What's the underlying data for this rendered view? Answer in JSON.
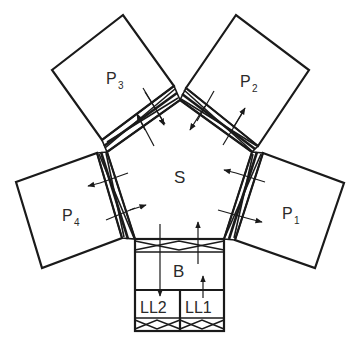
{
  "diagram": {
    "title": "",
    "type": "cluster-tool-layout",
    "nodes": [
      {
        "id": "S",
        "label": "S",
        "description": "central transfer chamber (pentagon)"
      },
      {
        "id": "P1",
        "label": "P",
        "subscript": "1",
        "description": "process chamber 1"
      },
      {
        "id": "P2",
        "label": "P",
        "subscript": "2",
        "description": "process chamber 2"
      },
      {
        "id": "P3",
        "label": "P",
        "subscript": "3",
        "description": "process chamber 3"
      },
      {
        "id": "P4",
        "label": "P",
        "subscript": "4",
        "description": "process chamber 4"
      },
      {
        "id": "B",
        "label": "B",
        "description": "buffer chamber"
      },
      {
        "id": "LL1",
        "label": "LL1",
        "description": "load lock 1"
      },
      {
        "id": "LL2",
        "label": "LL2",
        "description": "load lock 2"
      }
    ],
    "edges": [
      {
        "from": "S",
        "to": "P1",
        "type": "bidirectional",
        "via": "gate valve"
      },
      {
        "from": "S",
        "to": "P2",
        "type": "bidirectional",
        "via": "gate valve"
      },
      {
        "from": "S",
        "to": "P3",
        "type": "bidirectional",
        "via": "gate valve"
      },
      {
        "from": "S",
        "to": "P4",
        "type": "bidirectional",
        "via": "gate valve"
      },
      {
        "from": "B",
        "to": "S",
        "type": "directed",
        "via": "gate valve"
      },
      {
        "from": "S",
        "to": "LL2",
        "type": "directed",
        "via": "B"
      },
      {
        "from": "LL1",
        "to": "B",
        "type": "directed"
      }
    ]
  },
  "labels": {
    "S": "S",
    "B": "B",
    "LL1": "LL1",
    "LL2": "LL2",
    "P1_main": "P",
    "P1_sub": "1",
    "P2_main": "P",
    "P2_sub": "2",
    "P3_main": "P",
    "P3_sub": "3",
    "P4_main": "P",
    "P4_sub": "4"
  }
}
